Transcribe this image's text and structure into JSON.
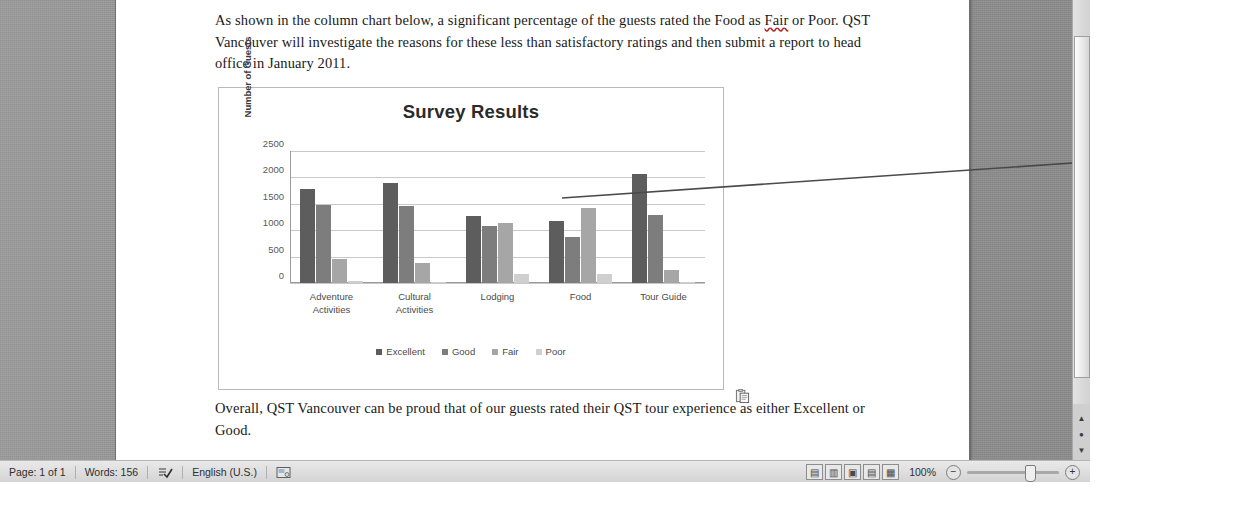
{
  "document": {
    "paragraph_top": "As shown in the column chart below, a significant percentage of the guests rated the Food as Fair or Poor. QST Vancouver will investigate the reasons for these less than satisfactory ratings and then submit a report to head office in January 2011.",
    "paragraph_top_pre": "As shown in the column chart below, a significant percentage of the guests rated the Food as ",
    "paragraph_top_flagged": "Fair",
    "paragraph_top_post": " or Poor. QST Vancouver will investigate the reasons for these less than satisfactory ratings and then submit a report to head office in January 2011.",
    "paragraph_bottom": "Overall, QST Vancouver can be proud that of our guests rated their QST tour experience as either Excellent or Good."
  },
  "annotation": {
    "line1": "Columns",
    "line2": "updated"
  },
  "chart_data": {
    "type": "bar",
    "title": "Survey Results",
    "xlabel": "",
    "ylabel": "Number of Guests",
    "ylim": [
      0,
      2500
    ],
    "yticks": [
      2500,
      2000,
      1500,
      1000,
      500,
      0
    ],
    "grid": true,
    "legend_position": "bottom",
    "categories": [
      "Adventure Activities",
      "Cultural Activities",
      "Lodging",
      "Food",
      "Tour Guide"
    ],
    "series": [
      {
        "name": "Excellent",
        "color": "#5d5d5d",
        "values": [
          1790,
          1890,
          1270,
          1180,
          2070
        ]
      },
      {
        "name": "Good",
        "color": "#7d7d7d",
        "values": [
          1470,
          1450,
          1080,
          880,
          1290
        ]
      },
      {
        "name": "Fair",
        "color": "#a6a6a6",
        "values": [
          450,
          375,
          1130,
          1420,
          255
        ]
      },
      {
        "name": "Poor",
        "color": "#cfcfcf",
        "values": [
          30,
          25,
          180,
          165,
          20
        ]
      }
    ]
  },
  "statusbar": {
    "page": "Page: 1 of 1",
    "words": "Words: 156",
    "proofing_icon": "spelling-check-icon",
    "language": "English (U.S.)",
    "macro_icon": "macro-record-icon",
    "view_buttons": [
      {
        "name": "print-layout-view",
        "glyph": "▤"
      },
      {
        "name": "full-screen-reading-view",
        "glyph": "▥"
      },
      {
        "name": "web-layout-view",
        "glyph": "▣"
      },
      {
        "name": "outline-view",
        "glyph": "▤"
      },
      {
        "name": "draft-view",
        "glyph": "▦"
      }
    ],
    "zoom_level": "100%",
    "zoom_out": "−",
    "zoom_in": "+"
  },
  "scrollbar": {
    "browse_prev": "▲",
    "browse_object": "●",
    "browse_next": "▼"
  }
}
